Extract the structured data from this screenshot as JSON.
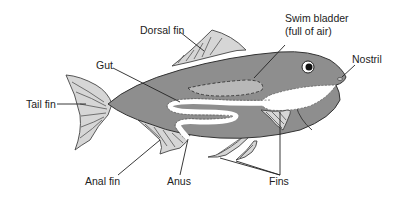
{
  "diagram": {
    "labels": {
      "dorsal_fin": "Dorsal fin",
      "swim_bladder_line1": "Swim bladder",
      "swim_bladder_line2": "(full of air)",
      "gut": "Gut",
      "nostril": "Nostril",
      "tail_fin": "Tail fin",
      "anal_fin": "Anal fin",
      "anus": "Anus",
      "fins": "Fins"
    },
    "colors": {
      "body": "#8e8e8e",
      "fins": "#d6d6d6",
      "swim_bladder": "#b8b8b8",
      "belly": "#ffffff",
      "outline": "#333333"
    }
  }
}
